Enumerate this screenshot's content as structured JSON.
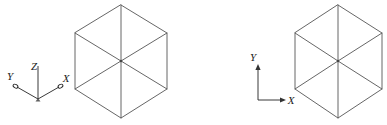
{
  "figure": {
    "title": "",
    "background_color": "#ffffff",
    "stroke_color": "#555555",
    "axis_color": "#222222",
    "label_color": "#1a1a1a",
    "width": 387,
    "height": 125
  },
  "panels": [
    {
      "id": "left-panel",
      "name": "isometric-view-3d-axes",
      "axes": {
        "type": "3d-isometric",
        "origin": [
          38,
          99
        ],
        "labels": [
          {
            "name": "x-axis-label",
            "text": "X",
            "x": 63,
            "y": 79
          },
          {
            "name": "y-axis-label",
            "text": "Y",
            "x": 9,
            "y": 76
          },
          {
            "name": "z-axis-label",
            "text": "Z",
            "x": 34,
            "y": 70
          }
        ],
        "arrowheads": [
          "x-open-arrowhead",
          "y-open-arrowhead"
        ],
        "rays": [
          {
            "name": "z-axis-ray",
            "to": [
              38,
              66
            ]
          },
          {
            "name": "x-axis-ray",
            "to": [
              58,
              87
            ]
          },
          {
            "name": "y-axis-ray",
            "to": [
              17,
              87
            ]
          }
        ]
      },
      "hexagon": {
        "name": "isometric-cube-hexagon-left",
        "center": [
          121,
          61
        ],
        "vertices": [
          [
            121,
            5
          ],
          [
            167,
            33
          ],
          [
            167,
            89
          ],
          [
            121,
            118
          ],
          [
            75,
            89
          ],
          [
            75,
            33
          ]
        ],
        "internal_edges": [
          "center-to-top",
          "center-to-bottom",
          "center-to-upper-left",
          "center-to-lower-right"
        ]
      }
    },
    {
      "id": "right-panel",
      "name": "isometric-view-2d-axes",
      "axes": {
        "type": "2d-cartesian",
        "origin": [
          258,
          100
        ],
        "labels": [
          {
            "name": "x-axis-label",
            "text": "X",
            "x": 288,
            "y": 104
          },
          {
            "name": "y-axis-label",
            "text": "Y",
            "x": 252,
            "y": 63
          }
        ],
        "arrowheads": [
          "x-solid-arrowhead",
          "y-solid-arrowhead"
        ],
        "rays": [
          {
            "name": "x-axis-ray",
            "to": [
              283,
              100
            ]
          },
          {
            "name": "y-axis-ray",
            "to": [
              258,
              70
            ]
          }
        ]
      },
      "hexagon": {
        "name": "isometric-cube-hexagon-right",
        "center": [
          338,
          61
        ],
        "vertices": [
          [
            338,
            5
          ],
          [
            382,
            33
          ],
          [
            382,
            89
          ],
          [
            338,
            118
          ],
          [
            295,
            89
          ],
          [
            295,
            33
          ]
        ],
        "internal_edges": [
          "center-to-top",
          "center-to-bottom",
          "center-to-upper-left",
          "center-to-lower-right"
        ]
      }
    }
  ]
}
